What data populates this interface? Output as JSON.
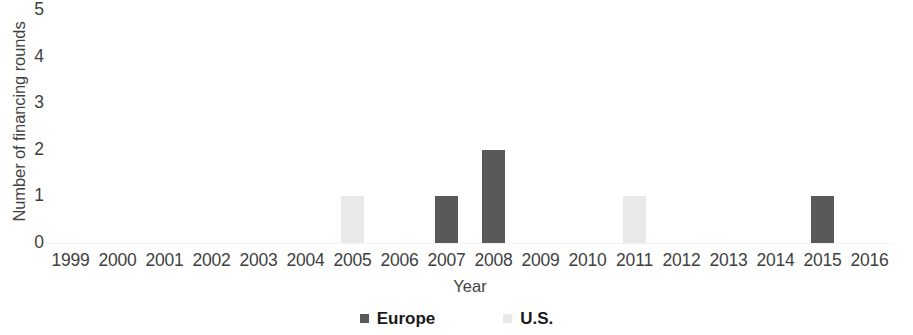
{
  "chart_data": {
    "type": "bar",
    "title": "",
    "subtitle": "",
    "xlabel": "Year",
    "ylabel": "Number of financing rounds",
    "categories": [
      "1999",
      "2000",
      "2001",
      "2002",
      "2003",
      "2004",
      "2005",
      "2006",
      "2007",
      "2008",
      "2009",
      "2010",
      "2011",
      "2012",
      "2013",
      "2014",
      "2015",
      "2016"
    ],
    "series": [
      {
        "name": "Europe",
        "color": "#595959",
        "values": [
          0,
          0,
          0,
          0,
          0,
          0,
          0,
          0,
          1,
          2,
          0,
          0,
          0,
          0,
          0,
          0,
          1,
          0
        ]
      },
      {
        "name": "U.S.",
        "color": "#e9e9e9",
        "values": [
          0,
          0,
          0,
          0,
          0,
          0,
          1,
          0,
          0,
          0,
          0,
          0,
          1,
          0,
          0,
          0,
          0,
          0
        ]
      }
    ],
    "ylim": [
      0,
      5
    ],
    "y_ticks": [
      "0",
      "1",
      "2",
      "3",
      "4",
      "5"
    ],
    "grid": false,
    "legend_position": "bottom"
  },
  "legend": {
    "items": [
      {
        "label": "Europe",
        "swatch": "legend-swatch-europe"
      },
      {
        "label": "U.S.",
        "swatch": "legend-swatch-us"
      }
    ]
  }
}
